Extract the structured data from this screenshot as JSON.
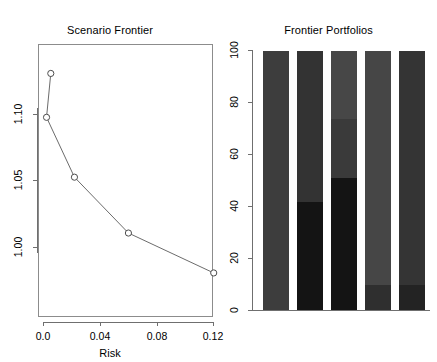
{
  "chart_data": [
    {
      "type": "line",
      "title": "Scenario Frontier",
      "xlabel": "Risk",
      "ylabel": "",
      "xlim": [
        0.0,
        0.1265
      ],
      "ylim": [
        0.9685,
        1.1365
      ],
      "xticks": [
        "0.0",
        "0.04",
        "0.08",
        "0.12"
      ],
      "xtick_values": [
        0.0,
        0.04,
        0.08,
        0.12
      ],
      "yticks": [
        "1.10",
        "1.05",
        "1.00"
      ],
      "ytick_values": [
        1.1,
        1.05,
        1.0
      ],
      "grid": false,
      "legend": "none",
      "marker": "open-circle",
      "x": [
        0.0055,
        0.0025,
        0.0222,
        0.0603,
        0.1205
      ],
      "y": [
        1.1305,
        1.0975,
        1.0525,
        1.0105,
        0.9805
      ],
      "points": [
        {
          "x": 0.0055,
          "y": 1.1305
        },
        {
          "x": 0.0025,
          "y": 1.0975
        },
        {
          "x": 0.0222,
          "y": 1.0525
        },
        {
          "x": 0.0603,
          "y": 1.0105
        },
        {
          "x": 0.1205,
          "y": 0.9805
        }
      ]
    },
    {
      "type": "bar",
      "title": "Frontier Portfolios",
      "xlabel": "",
      "ylabel": "",
      "ylim": [
        0,
        100
      ],
      "yticks": [
        "0",
        "20",
        "40",
        "60",
        "80",
        "100"
      ],
      "ytick_values": [
        0,
        20,
        40,
        60,
        80,
        100
      ],
      "stacked": true,
      "grid": false,
      "legend": "none",
      "categories": [
        "1",
        "2",
        "3",
        "4",
        "5"
      ],
      "series": [
        {
          "name": "asset-1",
          "color": "#141414",
          "values": [
            0,
            42,
            51,
            10,
            10
          ]
        },
        {
          "name": "asset-2",
          "color": "#333333",
          "values": [
            0,
            58,
            23,
            0,
            90
          ]
        },
        {
          "name": "asset-3",
          "color": "#3d3d3d",
          "values": [
            100,
            0,
            26,
            90,
            0
          ]
        }
      ],
      "bars": [
        {
          "label": "1",
          "segments": [
            {
              "value": 100,
              "color": "#3d3d3d"
            }
          ]
        },
        {
          "label": "2",
          "segments": [
            {
              "value": 42,
              "color": "#141414"
            },
            {
              "value": 58,
              "color": "#333333"
            }
          ]
        },
        {
          "label": "3",
          "segments": [
            {
              "value": 51,
              "color": "#141414"
            },
            {
              "value": 23,
              "color": "#3a3a3a"
            },
            {
              "value": 26,
              "color": "#474747"
            }
          ]
        },
        {
          "label": "4",
          "segments": [
            {
              "value": 10,
              "color": "#2f2f2f"
            },
            {
              "value": 90,
              "color": "#464646"
            }
          ]
        },
        {
          "label": "5",
          "segments": [
            {
              "value": 10,
              "color": "#232323"
            },
            {
              "value": 90,
              "color": "#343434"
            }
          ]
        }
      ]
    }
  ],
  "left_panel": {
    "title": "Scenario Frontier",
    "x_axis_title": "Risk",
    "x_tick_labels": [
      "0.0",
      "0.04",
      "0.08",
      "0.12"
    ],
    "y_tick_labels": [
      "1.10",
      "1.05",
      "1.00"
    ]
  },
  "right_panel": {
    "title": "Frontier Portfolios",
    "y_tick_labels": [
      "100",
      "80",
      "60",
      "40",
      "20",
      "0"
    ]
  },
  "colors": {
    "background": "#ffffff",
    "axis": "#6f6f6f",
    "box": "#8c8c8c",
    "line": "#5a5a5a",
    "marker_stroke": "#4d4d4d",
    "bar_dark": "#141414",
    "bar_mid": "#343434",
    "bar_light": "#464646"
  }
}
